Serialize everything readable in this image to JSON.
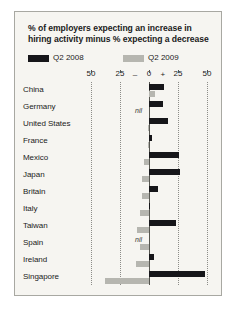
{
  "chart": {
    "title": "% of employers expecting an increase in hiring activity minus % expecting a decrease",
    "title_line1": "% of employers expecting an increase in",
    "title_line2": "hiring activity minus % expecting a decrease",
    "legend": [
      {
        "label": "Q2 2008",
        "color": "#16161a",
        "key": "y2008"
      },
      {
        "label": "Q2 2009",
        "color": "#b6b6b0",
        "key": "y2009"
      }
    ],
    "axis": {
      "ticks": [
        "50",
        "25",
        "0",
        "25",
        "50"
      ],
      "tick_values": [
        -50,
        -25,
        0,
        25,
        50
      ],
      "minus_sign": "–",
      "plus_sign": "+",
      "min": -50,
      "max": 50
    },
    "nil_label": "nil"
  },
  "chart_data": {
    "type": "bar",
    "orientation": "horizontal",
    "title": "% of employers expecting an increase in hiring activity minus % expecting a decrease",
    "xlabel": "",
    "ylabel": "",
    "xlim": [
      -50,
      50
    ],
    "grid": true,
    "legend_position": "top",
    "categories": [
      "China",
      "Germany",
      "United States",
      "France",
      "Mexico",
      "Japan",
      "Britain",
      "Italy",
      "Taiwan",
      "Spain",
      "Ireland",
      "Singapore"
    ],
    "series": [
      {
        "name": "Q2 2008",
        "color": "#16161a",
        "values": [
          13,
          12,
          16,
          3,
          26,
          27,
          8,
          1,
          23,
          0,
          4,
          48
        ],
        "nil_categories": [
          "Spain"
        ]
      },
      {
        "name": "Q2 2009",
        "color": "#b6b6b0",
        "values": [
          5,
          0,
          -1,
          -1,
          -4,
          -6,
          -6,
          -8,
          -10,
          -8,
          -11,
          -38
        ],
        "nil_categories": [
          "Germany"
        ]
      }
    ]
  }
}
